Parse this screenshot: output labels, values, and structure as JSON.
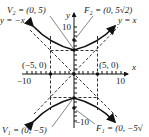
{
  "diagram": {
    "type": "hyperbola",
    "equation_form": "y^2/25 - x^2/25 = 1",
    "axes": {
      "x_label": "x",
      "y_label": "y",
      "x_ticks": [
        "−10",
        "10"
      ],
      "y_ticks": [
        "10",
        "−10"
      ]
    },
    "labels": {
      "V2": "V₂ = (0, 5)",
      "F2": "F₂ = (0, 5√2)",
      "V1": "V₁ = (0, −5)",
      "F1": "F₁ = (0, −5√",
      "asymptote_neg": "y = −x",
      "asymptote_pos": "y = x",
      "point_left": "(−5, 0)",
      "point_right": "(5, 0)"
    },
    "points": [
      {
        "name": "V2",
        "x": 0,
        "y": 5
      },
      {
        "name": "F2",
        "x": 0,
        "y": 7.07
      },
      {
        "name": "V1",
        "x": 0,
        "y": -5
      },
      {
        "name": "F1",
        "x": 0,
        "y": -7.07
      },
      {
        "name": "left",
        "x": -5,
        "y": 0
      },
      {
        "name": "right",
        "x": 5,
        "y": 0
      },
      {
        "name": "origin",
        "x": 0,
        "y": 0
      }
    ],
    "colors": {
      "curve": "#111111",
      "dashed": "#333333",
      "text": "#222222"
    }
  }
}
